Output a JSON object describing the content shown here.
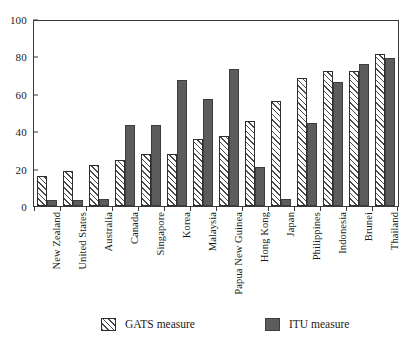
{
  "chart_data": {
    "type": "bar",
    "title": "",
    "xlabel": "",
    "ylabel": "",
    "ylim": [
      0,
      100
    ],
    "yticks": [
      0,
      20,
      40,
      60,
      80,
      100
    ],
    "grid": false,
    "legend_position": "bottom",
    "categories": [
      "New Zealand",
      "United States",
      "Australia",
      "Canada",
      "Singapore",
      "Korea",
      "Malaysia",
      "Papua New Guinea",
      "Hong Kong",
      "Japan",
      "Philippines",
      "Indonesia",
      "Brunei",
      "Thailand"
    ],
    "series": [
      {
        "name": "GATS measure",
        "style": "hatched",
        "color": "#ffffff",
        "values": [
          16,
          19,
          22,
          25,
          28,
          28,
          36,
          38,
          46,
          57,
          69,
          73,
          73,
          82
        ]
      },
      {
        "name": "ITU measure",
        "style": "solid",
        "color": "#5c5c5c",
        "values": [
          3,
          3,
          4,
          44,
          44,
          68,
          58,
          74,
          21,
          4,
          45,
          67,
          77,
          80
        ]
      }
    ]
  },
  "legend": {
    "items": [
      {
        "label": "GATS measure",
        "swatch": "hatched-swatch"
      },
      {
        "label": "ITU measure",
        "swatch": "solid-swatch"
      }
    ]
  },
  "colors": {
    "itu_fill": "#5c5c5c",
    "bar_border": "#2e2e2e",
    "axis": "#3a3a3a",
    "hatch": "#4a4a4a",
    "background": "#ffffff"
  }
}
